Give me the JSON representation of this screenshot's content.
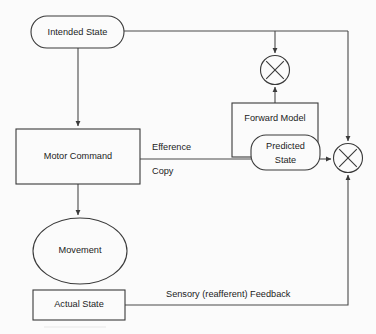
{
  "diagram": {
    "background_color": "#fbfbfb",
    "line_color": "#4a4a4a",
    "text_color": "#1c1c1c",
    "nodes": {
      "intended_state": "Intended State",
      "motor_command": "Motor Command",
      "movement": "Movement",
      "actual_state": "Actual State",
      "forward_model": "Forward Model",
      "predicted_state_line1": "Predicted",
      "predicted_state_line2": "State",
      "comparator_top": "✕",
      "comparator_right": "✕"
    },
    "edges": {
      "efference_copy_line1": "Efference",
      "efference_copy_line2": "Copy",
      "sensory_feedback": "Sensory (reafferent) Feedback"
    }
  }
}
